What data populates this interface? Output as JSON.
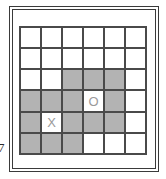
{
  "figure": {
    "name": "grid-diagram",
    "edge_glyph": "7",
    "colors": {
      "shaded_cell": "#b3b3b3",
      "empty_cell": "#ffffff",
      "grid_line": "#4a4a4a",
      "frame_line": "#3a3a3a",
      "marker_text": "#9a9a9a",
      "background": "#ffffff"
    }
  },
  "grid": {
    "rows": 6,
    "columns": 6,
    "cells": [
      [
        {
          "shaded": false,
          "label": ""
        },
        {
          "shaded": false,
          "label": ""
        },
        {
          "shaded": false,
          "label": ""
        },
        {
          "shaded": false,
          "label": ""
        },
        {
          "shaded": false,
          "label": ""
        },
        {
          "shaded": false,
          "label": ""
        }
      ],
      [
        {
          "shaded": false,
          "label": ""
        },
        {
          "shaded": false,
          "label": ""
        },
        {
          "shaded": false,
          "label": ""
        },
        {
          "shaded": false,
          "label": ""
        },
        {
          "shaded": false,
          "label": ""
        },
        {
          "shaded": false,
          "label": ""
        }
      ],
      [
        {
          "shaded": false,
          "label": ""
        },
        {
          "shaded": false,
          "label": ""
        },
        {
          "shaded": true,
          "label": ""
        },
        {
          "shaded": true,
          "label": ""
        },
        {
          "shaded": true,
          "label": ""
        },
        {
          "shaded": false,
          "label": ""
        }
      ],
      [
        {
          "shaded": true,
          "label": ""
        },
        {
          "shaded": true,
          "label": ""
        },
        {
          "shaded": true,
          "label": ""
        },
        {
          "shaded": false,
          "label": "O"
        },
        {
          "shaded": true,
          "label": ""
        },
        {
          "shaded": false,
          "label": ""
        }
      ],
      [
        {
          "shaded": true,
          "label": ""
        },
        {
          "shaded": false,
          "label": "X"
        },
        {
          "shaded": true,
          "label": ""
        },
        {
          "shaded": true,
          "label": ""
        },
        {
          "shaded": true,
          "label": ""
        },
        {
          "shaded": false,
          "label": ""
        }
      ],
      [
        {
          "shaded": true,
          "label": ""
        },
        {
          "shaded": true,
          "label": ""
        },
        {
          "shaded": true,
          "label": ""
        },
        {
          "shaded": false,
          "label": ""
        },
        {
          "shaded": false,
          "label": ""
        },
        {
          "shaded": false,
          "label": ""
        }
      ]
    ]
  }
}
